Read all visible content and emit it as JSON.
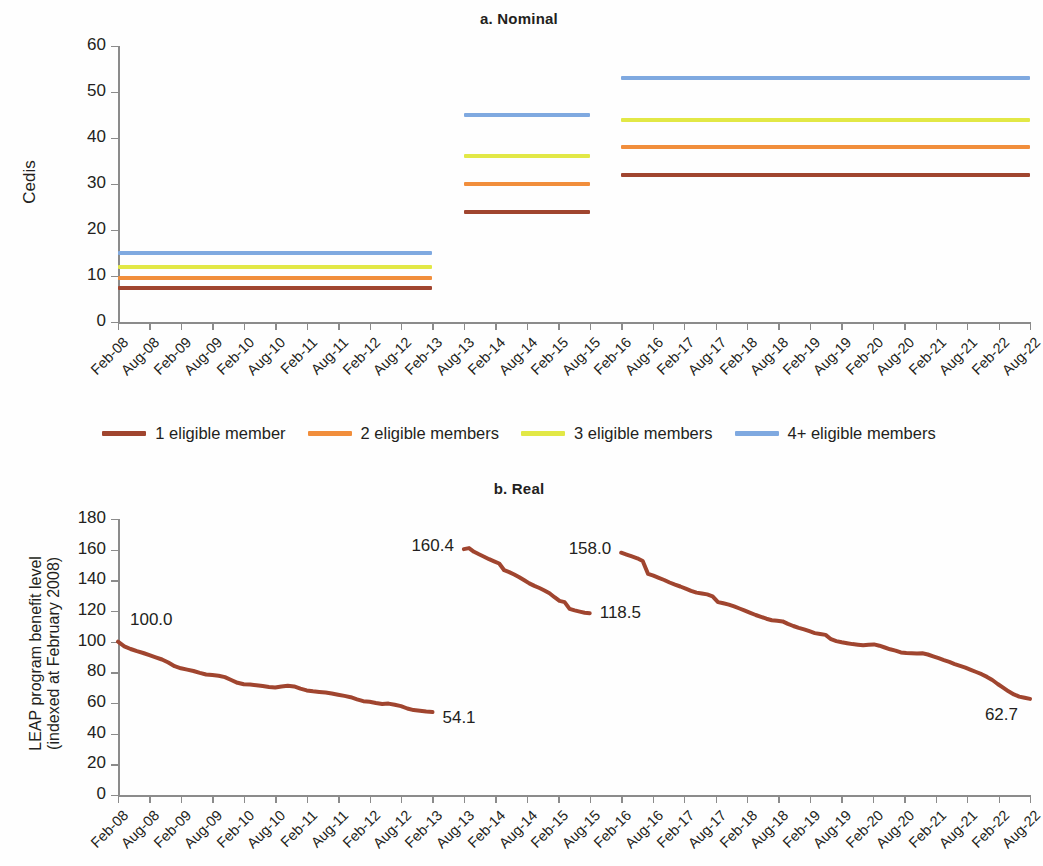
{
  "figure": {
    "panels": [
      {
        "key": "a",
        "title": "a. Nominal"
      },
      {
        "key": "b",
        "title": "b. Real"
      }
    ]
  },
  "legend": {
    "items": [
      {
        "label": "1 eligible member",
        "color": "#a0452f"
      },
      {
        "label": "2 eligible members",
        "color": "#f18e3c"
      },
      {
        "label": "3 eligible members",
        "color": "#e2e846"
      },
      {
        "label": "4+ eligible members",
        "color": "#7fa9e0"
      }
    ]
  },
  "colors": {
    "series1": "#a0452f",
    "series2": "#f18e3c",
    "series3": "#e2e846",
    "series4": "#7fa9e0",
    "axis": "#8b8b8b",
    "text": "#231f20"
  },
  "chart_data": [
    {
      "type": "line",
      "panel": "a",
      "title": "a. Nominal",
      "xlabel": "",
      "ylabel": "Cedis",
      "ylim": [
        0,
        60
      ],
      "yticks": [
        0,
        10,
        20,
        30,
        40,
        50,
        60
      ],
      "grid": false,
      "legend_position": "bottom",
      "x": [
        "Feb-08",
        "Aug-08",
        "Feb-09",
        "Aug-09",
        "Feb-10",
        "Aug-10",
        "Feb-11",
        "Aug-11",
        "Feb-12",
        "Aug-12",
        "Feb-13",
        "Aug-13",
        "Feb-14",
        "Aug-14",
        "Feb-15",
        "Aug-15",
        "Feb-16",
        "Aug-16",
        "Feb-17",
        "Aug-17",
        "Feb-18",
        "Aug-18",
        "Feb-19",
        "Aug-19",
        "Feb-20",
        "Aug-20",
        "Feb-21",
        "Aug-21",
        "Feb-22",
        "Aug-22"
      ],
      "series": [
        {
          "name": "1 eligible member",
          "color": "#a0452f",
          "step_levels": [
            7.5,
            24,
            32
          ]
        },
        {
          "name": "2 eligible members",
          "color": "#f18e3c",
          "step_levels": [
            9.5,
            30,
            38
          ]
        },
        {
          "name": "3 eligible members",
          "color": "#e2e846",
          "step_levels": [
            12,
            36,
            44
          ]
        },
        {
          "name": "4+ eligible members",
          "color": "#7fa9e0",
          "step_levels": [
            15,
            45,
            53
          ]
        }
      ],
      "segments": [
        {
          "from": "Feb-08",
          "to": "Feb-13"
        },
        {
          "from": "Aug-13",
          "to": "Aug-15"
        },
        {
          "from": "Feb-16",
          "to": "Aug-22"
        }
      ]
    },
    {
      "type": "line",
      "panel": "b",
      "title": "b. Real",
      "xlabel": "",
      "ylabel": "LEAP program benefit level (indexed at February 2008)",
      "ylabel_line1": "LEAP program benefit level",
      "ylabel_line2": "(indexed at February 2008)",
      "ylim": [
        0,
        180
      ],
      "yticks": [
        0,
        20,
        40,
        60,
        80,
        100,
        120,
        140,
        160,
        180
      ],
      "grid": false,
      "x": [
        "Feb-08",
        "Aug-08",
        "Feb-09",
        "Aug-09",
        "Feb-10",
        "Aug-10",
        "Feb-11",
        "Aug-11",
        "Feb-12",
        "Aug-12",
        "Feb-13",
        "Aug-13",
        "Feb-14",
        "Aug-14",
        "Feb-15",
        "Aug-15",
        "Feb-16",
        "Aug-16",
        "Feb-17",
        "Aug-17",
        "Feb-18",
        "Aug-18",
        "Feb-19",
        "Aug-19",
        "Feb-20",
        "Aug-20",
        "Feb-21",
        "Aug-21",
        "Feb-22",
        "Aug-22"
      ],
      "series": [
        {
          "name": "Real benefit level",
          "color": "#a0452f",
          "segments": [
            {
              "start_label": "100.0",
              "end_label": "54.1",
              "values": [
                100.0,
                97.0,
                95.2,
                93.8,
                92.6,
                91.2,
                89.8,
                88.4,
                86.4,
                84.0,
                82.6,
                81.8,
                80.9,
                79.6,
                78.6,
                78.2,
                77.8,
                76.9,
                75.0,
                73.2,
                72.2,
                72.0,
                71.6,
                71.0,
                70.5,
                70.2,
                70.8,
                71.2,
                70.8,
                69.4,
                68.2,
                67.6,
                67.2,
                66.8,
                66.2,
                65.4,
                64.6,
                63.8,
                62.4,
                61.2,
                60.8,
                60.0,
                59.4,
                59.6,
                58.8,
                58.0,
                56.4,
                55.4,
                54.9,
                54.4,
                54.1
              ]
            },
            {
              "start_label": "160.4",
              "end_label": "118.5",
              "values": [
                160.4,
                161.0,
                158.6,
                157.0,
                155.4,
                153.8,
                152.4,
                151.0,
                146.6,
                145.4,
                143.8,
                142.0,
                140.0,
                138.0,
                136.4,
                135.0,
                133.4,
                131.6,
                129.0,
                126.6,
                125.8,
                121.4,
                120.4,
                119.6,
                118.9,
                118.5
              ]
            },
            {
              "start_label": "158.0",
              "end_label": "62.7",
              "values": [
                158.0,
                156.8,
                155.6,
                154.4,
                152.6,
                144.2,
                143.0,
                141.6,
                140.2,
                138.6,
                137.2,
                136.0,
                134.6,
                133.2,
                132.0,
                131.4,
                130.8,
                129.6,
                125.8,
                125.0,
                124.2,
                123.0,
                121.6,
                120.2,
                118.8,
                117.4,
                116.2,
                115.0,
                114.0,
                113.6,
                113.2,
                111.6,
                110.2,
                109.0,
                108.0,
                106.8,
                105.6,
                105.0,
                104.4,
                101.6,
                100.4,
                99.6,
                99.0,
                98.4,
                98.0,
                97.6,
                98.0,
                98.2,
                97.4,
                96.2,
                95.0,
                94.2,
                93.0,
                92.6,
                92.4,
                92.2,
                92.4,
                91.6,
                90.4,
                89.2,
                88.0,
                86.8,
                85.4,
                84.2,
                83.0,
                81.6,
                80.2,
                78.8,
                77.0,
                75.0,
                72.4,
                70.0,
                67.6,
                65.6,
                64.2,
                63.4,
                62.7
              ]
            }
          ]
        }
      ],
      "annotations": [
        {
          "text": "100.0"
        },
        {
          "text": "54.1"
        },
        {
          "text": "160.4"
        },
        {
          "text": "118.5"
        },
        {
          "text": "158.0"
        },
        {
          "text": "62.7"
        }
      ]
    }
  ]
}
